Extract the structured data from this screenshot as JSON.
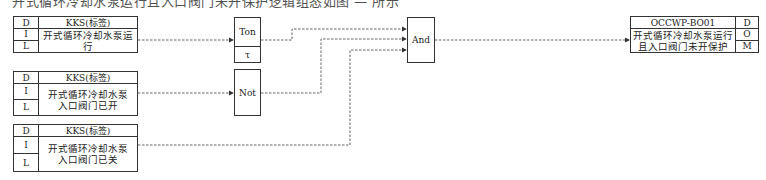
{
  "caption": "开式循环冷却水泵运行且入口阀门未开保护逻辑组态如图 — 所示",
  "inputs": [
    {
      "d": "D",
      "tag": "KKS(标签)",
      "i": "I",
      "l": "L",
      "desc_line1": "开式循环冷却水泵运行",
      "desc_line2": ""
    },
    {
      "d": "D",
      "tag": "KKS(标签)",
      "i": "I",
      "l": "L",
      "desc_line1": "开式循环冷却水泵",
      "desc_line2": "入口阀门已开"
    },
    {
      "d": "D",
      "tag": "KKS(标签)",
      "i": "I",
      "l": "L",
      "desc_line1": "开式循环冷却水泵",
      "desc_line2": "入口阀门已关"
    }
  ],
  "blocks": {
    "ton": {
      "label": "Ton",
      "param": "τ"
    },
    "not": {
      "label": "Not"
    },
    "and": {
      "label": "And"
    }
  },
  "output": {
    "tag": "OCCWP-BO01",
    "d": "D",
    "o": "O",
    "m": "M",
    "desc_line1": "开式循环冷却水泵运行",
    "desc_line2": "且入口阀门未开保护"
  },
  "colors": {
    "line": "#333333",
    "wire": "#555555"
  }
}
